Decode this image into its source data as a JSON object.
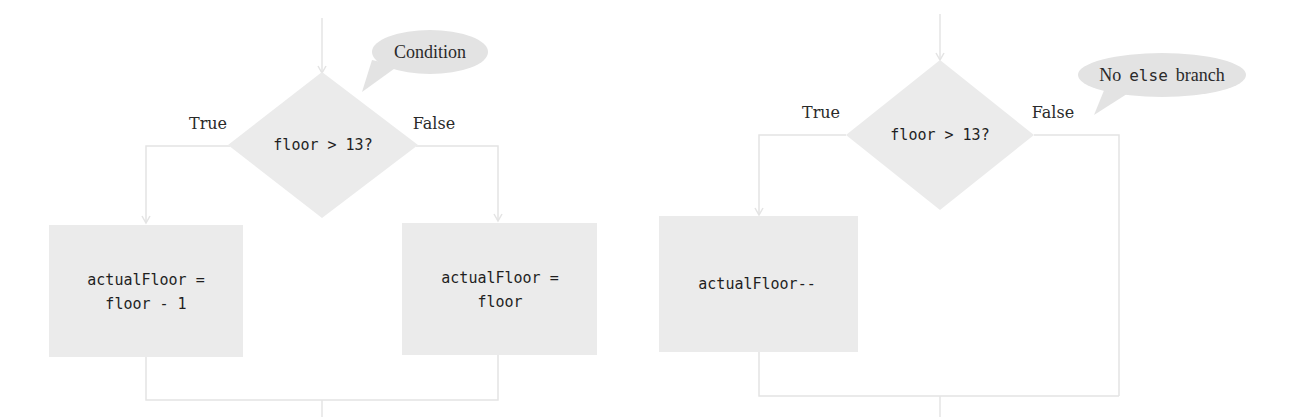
{
  "colors": {
    "shape_fill": "#ebebeb",
    "bubble_fill": "#e3e3e3",
    "connector": "#e4e4e4",
    "text": "#1f1f1f"
  },
  "left_flowchart": {
    "condition": "floor > 13?",
    "callout": "Condition",
    "true_label": "True",
    "false_label": "False",
    "true_box": {
      "line1": "actualFloor =",
      "line2": "floor - 1"
    },
    "false_box": {
      "line1": "actualFloor =",
      "line2": "floor"
    }
  },
  "right_flowchart": {
    "condition": "floor > 13?",
    "callout": {
      "prefix": "No",
      "code": "else",
      "suffix": "branch"
    },
    "true_label": "True",
    "false_label": "False",
    "true_box": {
      "line1": "actualFloor--"
    }
  }
}
